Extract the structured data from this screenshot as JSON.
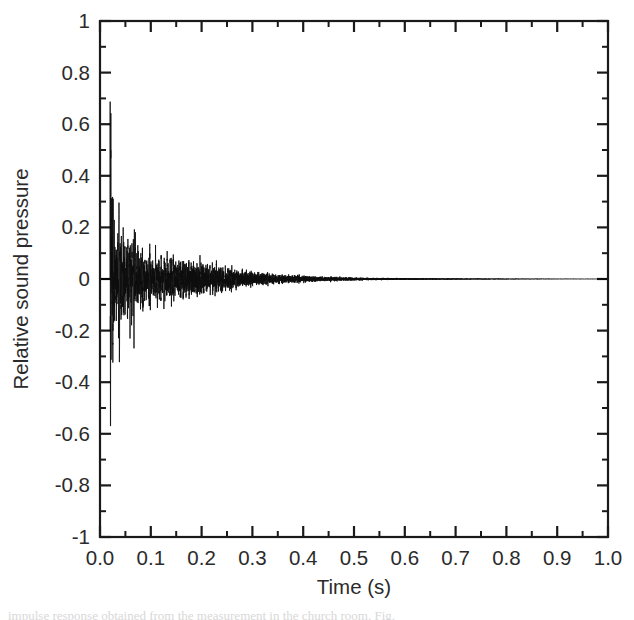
{
  "figure": {
    "background_color": "#ffffff",
    "trace_color": "#0d0d0d",
    "axis_color": "#1a1a1a",
    "label_color": "#2b2b2b",
    "caption_partial": "impulse response obtained from the measurement in the church room. Fig."
  },
  "chart_data": {
    "type": "line",
    "title": "",
    "subtitle": "",
    "xlabel": "Time (s)",
    "ylabel": "Relative sound pressure",
    "xlim": [
      0.0,
      1.0
    ],
    "ylim": [
      -1.0,
      1.0
    ],
    "grid": false,
    "legend": [],
    "legend_position": "none",
    "x_major_ticks": [
      0.0,
      0.1,
      0.2,
      0.3,
      0.4,
      0.5,
      0.6,
      0.7,
      0.8,
      0.9,
      1.0
    ],
    "x_major_tick_labels": [
      "0.0",
      "0.1",
      "0.2",
      "0.3",
      "0.4",
      "0.5",
      "0.6",
      "0.7",
      "0.8",
      "0.9",
      "1.0"
    ],
    "x_minor_ticks": [
      0.05,
      0.15,
      0.25,
      0.35,
      0.45,
      0.55,
      0.65,
      0.75,
      0.85,
      0.95
    ],
    "y_major_ticks": [
      -1.0,
      -0.8,
      -0.6,
      -0.4,
      -0.2,
      0.0,
      0.2,
      0.4,
      0.6,
      0.8,
      1.0
    ],
    "y_major_tick_labels": [
      "-1",
      "-0.8",
      "-0.6",
      "-0.4",
      "-0.2",
      "0",
      "0.2",
      "0.4",
      "0.6",
      "0.8",
      "1"
    ],
    "y_minor_ticks": [
      -0.9,
      -0.7,
      -0.5,
      -0.3,
      -0.1,
      0.1,
      0.3,
      0.5,
      0.7,
      0.9
    ],
    "tick_direction": "in",
    "series": [
      {
        "name": "impulse response",
        "description": "Room-acoustic impulse response: dense oscillatory waveform starting at t=0.02 s, positive peak 0.84 and negative peak -0.57, decaying exponentially to near zero by t=0.65 s.",
        "onset_time": 0.02,
        "max_value": 0.84,
        "max_value_time": 0.024,
        "min_value": -0.57,
        "min_value_time": 0.037,
        "decay_rate_per_second": 9.2,
        "oscillation_frequency_hz": 430,
        "envelope_samples_time": [
          0.0,
          0.02,
          0.03,
          0.05,
          0.08,
          0.1,
          0.15,
          0.2,
          0.25,
          0.3,
          0.35,
          0.4,
          0.45,
          0.5,
          0.55,
          0.6,
          0.65,
          0.7,
          0.8,
          0.9,
          1.0
        ],
        "envelope_samples_amplitude": [
          0.0,
          0.84,
          0.57,
          0.45,
          0.4,
          0.38,
          0.33,
          0.3,
          0.22,
          0.16,
          0.12,
          0.09,
          0.065,
          0.048,
          0.035,
          0.025,
          0.018,
          0.013,
          0.007,
          0.004,
          0.002
        ]
      }
    ]
  }
}
